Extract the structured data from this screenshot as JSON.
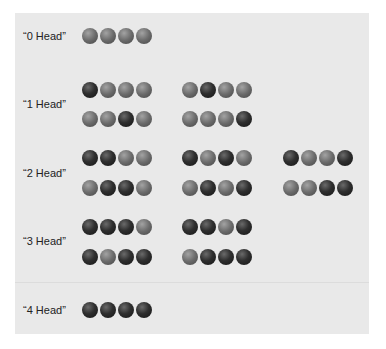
{
  "diagram": {
    "title": "",
    "legend": {
      "H": "dark ball (head)",
      "T": "gray ball (tail)"
    },
    "colors": {
      "panel_bg": "#e9e9e9",
      "head": "#2a2a2a",
      "tail": "#707070"
    },
    "sections": [
      {
        "label": "“0 Head”",
        "label_y": 36,
        "rows": [
          {
            "y": 36,
            "groups": [
              "TTTT"
            ]
          }
        ]
      },
      {
        "label": "“1 Head”",
        "label_y": 104,
        "rows": [
          {
            "y": 90,
            "groups": [
              "HTTT",
              "THTT"
            ]
          },
          {
            "y": 119,
            "groups": [
              "TTHT",
              "TTTH"
            ]
          }
        ]
      },
      {
        "label": "“2 Head”",
        "label_y": 173,
        "rows": [
          {
            "y": 158,
            "groups": [
              "HHTT",
              "HTHT",
              "HTTH"
            ]
          },
          {
            "y": 188,
            "groups": [
              "THHT",
              "THTH",
              "TTHH"
            ]
          }
        ]
      },
      {
        "label": "“3 Head”",
        "label_y": 241,
        "rows": [
          {
            "y": 227,
            "groups": [
              "HHHT",
              "HHTH"
            ]
          },
          {
            "y": 257,
            "groups": [
              "HTHH",
              "THHH"
            ]
          }
        ]
      },
      {
        "label": "“4 Head”",
        "label_y": 310,
        "rows": [
          {
            "y": 310,
            "groups": [
              "HHHH"
            ]
          }
        ]
      }
    ],
    "group_x": [
      82,
      182,
      283
    ]
  }
}
